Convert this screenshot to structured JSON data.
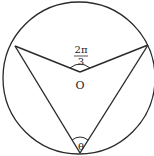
{
  "diagram": {
    "type": "circle-geometry",
    "center_label": "O",
    "central_angle": {
      "numerator": "2π",
      "denominator": "3"
    },
    "inscribed_angle": "θ",
    "colors": {
      "stroke": "#2a2a2a",
      "background": "#ffffff"
    }
  }
}
